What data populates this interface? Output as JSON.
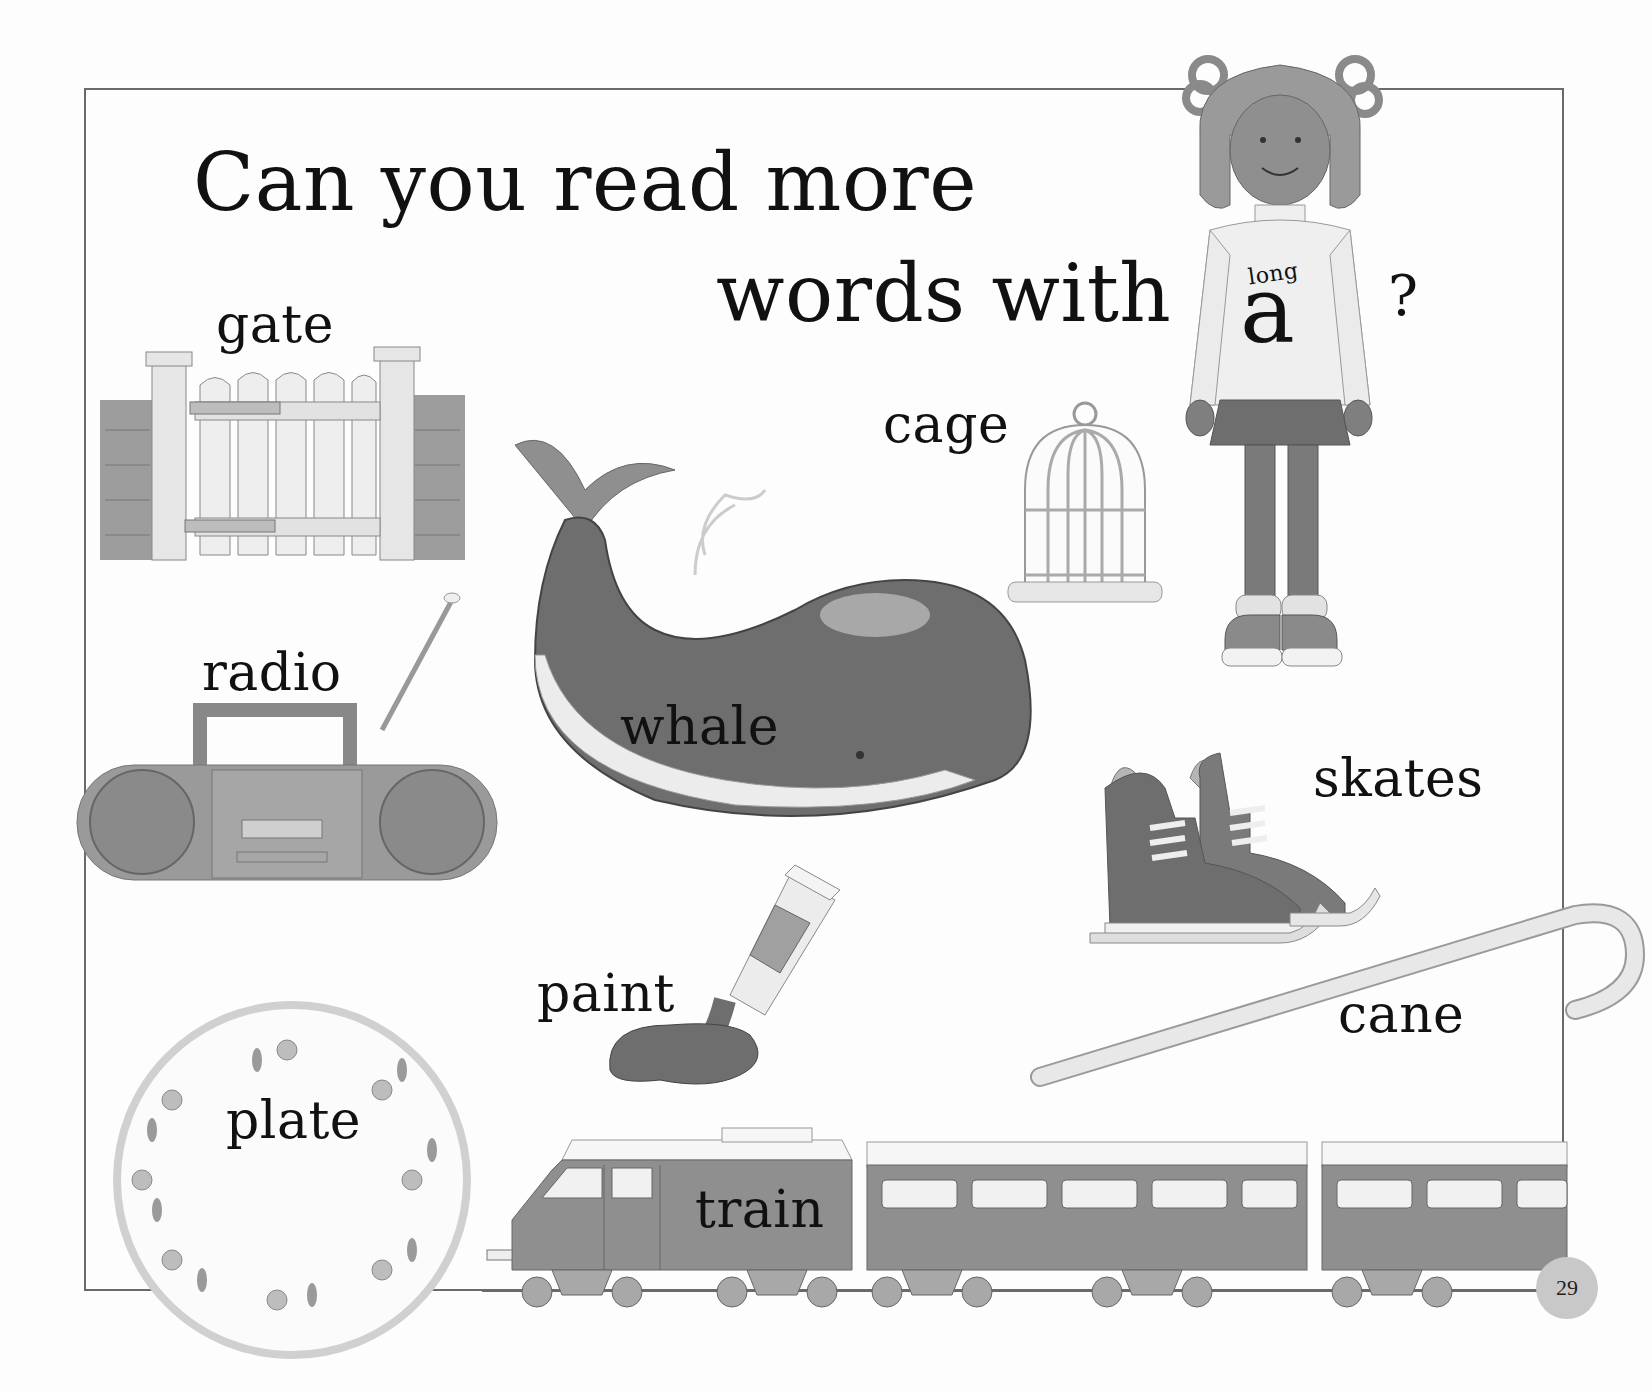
{
  "page": {
    "title_line1": "Can you read more",
    "title_line2": "words with",
    "question_mark": "?",
    "sweater_small": "long",
    "sweater_letter": "a",
    "page_number": "29"
  },
  "words": {
    "gate": "gate",
    "cage": "cage",
    "radio": "radio",
    "whale": "whale",
    "skates": "skates",
    "paint": "paint",
    "cane": "cane",
    "plate": "plate",
    "train": "train"
  },
  "colors": {
    "frame": "#6a6a6a",
    "ink": "#111111",
    "grey_dark": "#6e6e6e",
    "grey_mid": "#9a9a9a",
    "grey_light": "#d8d8d8",
    "page_number_circle": "#c8c8c8"
  }
}
